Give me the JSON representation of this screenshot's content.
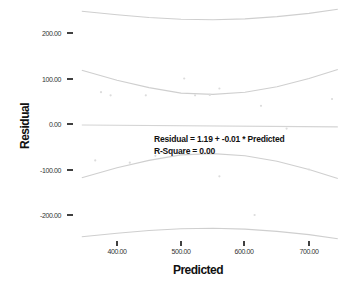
{
  "chart_data": {
    "type": "scatter",
    "title": "",
    "xlabel": "Predicted",
    "ylabel": "Residual",
    "xlim": [
      345,
      745
    ],
    "ylim": [
      -260,
      260
    ],
    "xticks": [
      400,
      500,
      600,
      700
    ],
    "xtick_labels": [
      "400.00",
      "500.00",
      "600.00",
      "700.00"
    ],
    "yticks": [
      200,
      100,
      0,
      -100,
      -200
    ],
    "ytick_labels": [
      "200.00",
      "100.00",
      "0.00",
      "-100.00",
      "-200.00"
    ],
    "grid": false,
    "legend": null,
    "fit_line": {
      "intercept": 1.19,
      "slope": -0.01
    },
    "annotations": [
      "Residual = 1.19 + -0.01 * Predicted",
      "R-Square = 0.00"
    ],
    "mean_ci_band": {
      "x": [
        345,
        400,
        450,
        500,
        550,
        600,
        650,
        700,
        745
      ],
      "upper": [
        118,
        96,
        80,
        68,
        65,
        70,
        82,
        100,
        120
      ],
      "lower": [
        -118,
        -96,
        -80,
        -68,
        -65,
        -70,
        -82,
        -100,
        -120
      ]
    },
    "prediction_band": {
      "x": [
        345,
        400,
        450,
        500,
        550,
        600,
        650,
        700,
        745
      ],
      "upper": [
        248,
        240,
        234,
        230,
        229,
        231,
        236,
        243,
        252
      ],
      "lower": [
        -248,
        -240,
        -234,
        -230,
        -229,
        -231,
        -236,
        -243,
        -252
      ]
    },
    "points": [
      {
        "x": 366,
        "y": -80
      },
      {
        "x": 375,
        "y": 70
      },
      {
        "x": 390,
        "y": 63
      },
      {
        "x": 420,
        "y": -85
      },
      {
        "x": 445,
        "y": 63
      },
      {
        "x": 460,
        "y": -70
      },
      {
        "x": 505,
        "y": 100
      },
      {
        "x": 522,
        "y": 63
      },
      {
        "x": 545,
        "y": 64
      },
      {
        "x": 560,
        "y": 78
      },
      {
        "x": 560,
        "y": -115
      },
      {
        "x": 615,
        "y": -200
      },
      {
        "x": 625,
        "y": 40
      },
      {
        "x": 665,
        "y": -10
      },
      {
        "x": 700,
        "y": -100
      },
      {
        "x": 736,
        "y": 55
      }
    ]
  },
  "labels": {
    "x_axis_title": "Predicted",
    "y_axis_title": "Residual",
    "equation": "Residual = 1.19 + -0.01 * Predicted",
    "r_square": "R-Square = 0.00",
    "yticks": [
      "200.00",
      "100.00",
      "0.00",
      "-100.00",
      "-200.00"
    ],
    "xticks": [
      "400.00",
      "500.00",
      "600.00",
      "700.00"
    ]
  }
}
